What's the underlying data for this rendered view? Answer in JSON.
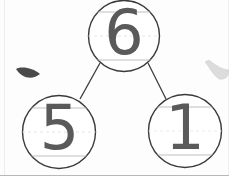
{
  "worksheet": {
    "type": "number-bond",
    "title": "Number bond diagram",
    "background_color": "#fdfdfd",
    "ink_color": "#5a5a5a",
    "circle_stroke_color": "#3a3a3a",
    "guideline_color": "#bfbfbf"
  },
  "bond": {
    "whole": {
      "label": "6",
      "position": "top",
      "center_x": 124,
      "center_y": 36,
      "radius": 36
    },
    "parts": [
      {
        "label": "5",
        "position": "bottom-left",
        "center_x": 59,
        "center_y": 132,
        "radius": 37
      },
      {
        "label": "1",
        "position": "bottom-right",
        "center_x": 185,
        "center_y": 131,
        "radius": 37
      }
    ],
    "connectors": [
      {
        "from": "whole",
        "to": "left-part"
      },
      {
        "from": "whole",
        "to": "right-part"
      }
    ]
  },
  "guidelines": {
    "description": "handwriting practice lines inside each circle",
    "per_circle": [
      "top-line",
      "mid-dashed-line",
      "baseline"
    ]
  },
  "marks": [
    {
      "name": "crescent-mark-left",
      "shade": "dark",
      "color": "#4a4a4a",
      "x": 16,
      "y": 66
    },
    {
      "name": "crescent-mark-right",
      "shade": "light",
      "color": "#dcdcdc",
      "x": 203,
      "y": 61
    }
  ]
}
